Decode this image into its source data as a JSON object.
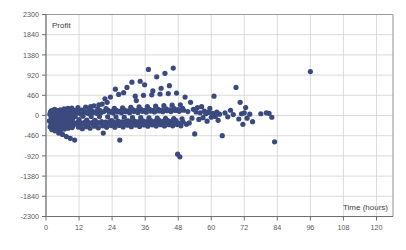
{
  "chart_data": {
    "type": "scatter",
    "title": "",
    "xlabel": "Time (hours)",
    "ylabel": "Profit",
    "xlim": [
      0,
      126
    ],
    "ylim": [
      -2300,
      2300
    ],
    "grid": true,
    "legend": "none",
    "marker_color": "#3b4a7e",
    "marker_size": 2.6,
    "x_ticks": [
      0,
      12,
      24,
      36,
      48,
      60,
      72,
      84,
      96,
      108,
      120
    ],
    "x_tick_labels": [
      "0",
      "12",
      "24",
      "36",
      "48",
      "60",
      "72",
      "84",
      "96",
      "108",
      "120"
    ],
    "y_ticks": [
      -2300,
      -1840,
      -1380,
      -920,
      -460,
      0,
      460,
      920,
      1380,
      1840,
      2300
    ],
    "y_tick_labels": [
      "-2300",
      "-1840",
      "-1380",
      "-920",
      "-460",
      "0",
      "460",
      "920",
      "1380",
      "1840",
      "2300"
    ],
    "points": [
      [
        1.2,
        -120
      ],
      [
        1.4,
        30
      ],
      [
        1.5,
        -260
      ],
      [
        1.6,
        80
      ],
      [
        1.8,
        -180
      ],
      [
        1.9,
        -40
      ],
      [
        2.0,
        110
      ],
      [
        2.1,
        -320
      ],
      [
        2.2,
        -60
      ],
      [
        2.3,
        60
      ],
      [
        2.4,
        -200
      ],
      [
        2.5,
        -10
      ],
      [
        2.6,
        -150
      ],
      [
        2.7,
        90
      ],
      [
        2.8,
        -280
      ],
      [
        2.9,
        20
      ],
      [
        3.0,
        -100
      ],
      [
        3.1,
        140
      ],
      [
        3.2,
        -350
      ],
      [
        3.3,
        -50
      ],
      [
        3.4,
        70
      ],
      [
        3.5,
        -220
      ],
      [
        3.6,
        10
      ],
      [
        3.7,
        -130
      ],
      [
        3.8,
        120
      ],
      [
        3.9,
        -300
      ],
      [
        4.0,
        -70
      ],
      [
        4.1,
        50
      ],
      [
        4.2,
        -240
      ],
      [
        4.3,
        0
      ],
      [
        4.4,
        -160
      ],
      [
        4.5,
        100
      ],
      [
        4.6,
        -400
      ],
      [
        4.7,
        -30
      ],
      [
        4.8,
        80
      ],
      [
        4.9,
        -210
      ],
      [
        5.0,
        30
      ],
      [
        5.1,
        -140
      ],
      [
        5.2,
        130
      ],
      [
        5.3,
        -330
      ],
      [
        5.4,
        -80
      ],
      [
        5.5,
        60
      ],
      [
        5.6,
        -250
      ],
      [
        5.7,
        10
      ],
      [
        5.8,
        -170
      ],
      [
        5.9,
        95
      ],
      [
        6.0,
        -430
      ],
      [
        6.1,
        -20
      ],
      [
        6.2,
        75
      ],
      [
        6.3,
        -230
      ],
      [
        6.4,
        40
      ],
      [
        6.5,
        -120
      ],
      [
        6.6,
        150
      ],
      [
        6.7,
        -310
      ],
      [
        6.8,
        -60
      ],
      [
        6.9,
        55
      ],
      [
        7.0,
        -270
      ],
      [
        7.1,
        5
      ],
      [
        7.2,
        -190
      ],
      [
        7.3,
        105
      ],
      [
        7.4,
        -480
      ],
      [
        7.5,
        -45
      ],
      [
        7.6,
        85
      ],
      [
        7.7,
        -215
      ],
      [
        7.8,
        35
      ],
      [
        7.9,
        -135
      ],
      [
        8.0,
        160
      ],
      [
        8.1,
        -290
      ],
      [
        8.2,
        -75
      ],
      [
        8.3,
        65
      ],
      [
        8.4,
        -245
      ],
      [
        8.5,
        15
      ],
      [
        8.6,
        -185
      ],
      [
        8.7,
        110
      ],
      [
        8.8,
        -520
      ],
      [
        8.9,
        -35
      ],
      [
        9.0,
        90
      ],
      [
        9.1,
        -205
      ],
      [
        9.2,
        45
      ],
      [
        9.3,
        -145
      ],
      [
        9.4,
        170
      ],
      [
        9.5,
        -275
      ],
      [
        9.6,
        -85
      ],
      [
        9.7,
        70
      ],
      [
        9.8,
        -235
      ],
      [
        9.9,
        25
      ],
      [
        10.0,
        -175
      ],
      [
        10.2,
        115
      ],
      [
        10.4,
        -560
      ],
      [
        10.6,
        -25
      ],
      [
        10.8,
        95
      ],
      [
        11.0,
        -195
      ],
      [
        11.2,
        55
      ],
      [
        11.4,
        -155
      ],
      [
        11.6,
        180
      ],
      [
        11.8,
        -265
      ],
      [
        12.0,
        -95
      ],
      [
        12.2,
        75
      ],
      [
        12.4,
        -225
      ],
      [
        12.6,
        35
      ],
      [
        12.8,
        -165
      ],
      [
        13.0,
        125
      ],
      [
        13.2,
        -300
      ],
      [
        13.4,
        -15
      ],
      [
        13.6,
        100
      ],
      [
        13.8,
        -185
      ],
      [
        14.0,
        60
      ],
      [
        14.2,
        -150
      ],
      [
        14.4,
        190
      ],
      [
        14.6,
        -255
      ],
      [
        14.8,
        -105
      ],
      [
        15.0,
        80
      ],
      [
        15.2,
        -215
      ],
      [
        15.4,
        45
      ],
      [
        15.6,
        -160
      ],
      [
        15.8,
        135
      ],
      [
        16.0,
        -290
      ],
      [
        16.2,
        200
      ],
      [
        16.4,
        -20
      ],
      [
        16.6,
        105
      ],
      [
        16.8,
        -180
      ],
      [
        17.0,
        65
      ],
      [
        17.2,
        -145
      ],
      [
        17.4,
        220
      ],
      [
        17.6,
        -245
      ],
      [
        17.8,
        -110
      ],
      [
        18.0,
        85
      ],
      [
        18.2,
        -205
      ],
      [
        18.4,
        50
      ],
      [
        18.6,
        -155
      ],
      [
        18.8,
        145
      ],
      [
        19.0,
        -280
      ],
      [
        19.2,
        240
      ],
      [
        19.4,
        -25
      ],
      [
        19.6,
        110
      ],
      [
        19.8,
        -175
      ],
      [
        20.0,
        70
      ],
      [
        20.2,
        -140
      ],
      [
        20.4,
        260
      ],
      [
        20.6,
        -235
      ],
      [
        20.8,
        -400
      ],
      [
        21.0,
        90
      ],
      [
        21.2,
        -200
      ],
      [
        21.4,
        380
      ],
      [
        21.6,
        -150
      ],
      [
        21.8,
        155
      ],
      [
        22.0,
        -270
      ],
      [
        22.2,
        300
      ],
      [
        22.4,
        -30
      ],
      [
        22.6,
        115
      ],
      [
        22.8,
        -170
      ],
      [
        23.0,
        75
      ],
      [
        23.2,
        -135
      ],
      [
        23.4,
        420
      ],
      [
        23.6,
        -230
      ],
      [
        23.8,
        -115
      ],
      [
        24.0,
        95
      ],
      [
        24.2,
        -195
      ],
      [
        24.4,
        55
      ],
      [
        24.6,
        -148
      ],
      [
        24.8,
        165
      ],
      [
        25.0,
        -265
      ],
      [
        25.2,
        600
      ],
      [
        25.4,
        -35
      ],
      [
        25.6,
        120
      ],
      [
        25.8,
        -168
      ],
      [
        26.0,
        80
      ],
      [
        26.2,
        -130
      ],
      [
        26.4,
        480
      ],
      [
        26.6,
        -225
      ],
      [
        26.8,
        -560
      ],
      [
        27.0,
        100
      ],
      [
        27.2,
        -190
      ],
      [
        27.4,
        60
      ],
      [
        27.6,
        -145
      ],
      [
        27.8,
        175
      ],
      [
        28.0,
        -260
      ],
      [
        28.2,
        520
      ],
      [
        28.4,
        -40
      ],
      [
        28.6,
        125
      ],
      [
        28.8,
        -165
      ],
      [
        29.0,
        85
      ],
      [
        29.2,
        -128
      ],
      [
        29.4,
        640
      ],
      [
        29.6,
        -220
      ],
      [
        29.8,
        -120
      ],
      [
        30.0,
        105
      ],
      [
        30.2,
        -188
      ],
      [
        30.4,
        65
      ],
      [
        30.6,
        -142
      ],
      [
        30.8,
        185
      ],
      [
        31.0,
        -255
      ],
      [
        31.2,
        760
      ],
      [
        31.4,
        -45
      ],
      [
        31.6,
        130
      ],
      [
        31.8,
        -162
      ],
      [
        32.0,
        90
      ],
      [
        32.2,
        -125
      ],
      [
        32.4,
        440
      ],
      [
        32.6,
        -218
      ],
      [
        32.8,
        340
      ],
      [
        33.0,
        110
      ],
      [
        33.2,
        -185
      ],
      [
        33.4,
        70
      ],
      [
        33.6,
        -140
      ],
      [
        33.8,
        195
      ],
      [
        34.0,
        -250
      ],
      [
        34.2,
        780
      ],
      [
        34.4,
        -50
      ],
      [
        34.6,
        135
      ],
      [
        34.8,
        -160
      ],
      [
        35.0,
        95
      ],
      [
        35.2,
        -122
      ],
      [
        35.4,
        460
      ],
      [
        35.6,
        -215
      ],
      [
        35.8,
        700
      ],
      [
        36.0,
        115
      ],
      [
        36.2,
        -182
      ],
      [
        36.4,
        75
      ],
      [
        36.6,
        -138
      ],
      [
        36.8,
        205
      ],
      [
        37.0,
        -245
      ],
      [
        37.2,
        1050
      ],
      [
        37.4,
        -55
      ],
      [
        37.6,
        140
      ],
      [
        37.8,
        -158
      ],
      [
        38.0,
        100
      ],
      [
        38.2,
        -120
      ],
      [
        38.4,
        470
      ],
      [
        38.6,
        -212
      ],
      [
        38.8,
        560
      ],
      [
        39.0,
        120
      ],
      [
        39.2,
        -180
      ],
      [
        39.4,
        80
      ],
      [
        39.6,
        -136
      ],
      [
        39.8,
        215
      ],
      [
        40.0,
        -240
      ],
      [
        40.2,
        880
      ],
      [
        40.4,
        -60
      ],
      [
        40.6,
        145
      ],
      [
        40.8,
        -155
      ],
      [
        41.0,
        105
      ],
      [
        41.2,
        -118
      ],
      [
        41.4,
        490
      ],
      [
        41.6,
        -210
      ],
      [
        41.8,
        620
      ],
      [
        42.0,
        125
      ],
      [
        42.2,
        -178
      ],
      [
        42.4,
        85
      ],
      [
        42.6,
        -134
      ],
      [
        42.8,
        225
      ],
      [
        43.0,
        -238
      ],
      [
        43.2,
        960
      ],
      [
        43.4,
        -65
      ],
      [
        43.6,
        150
      ],
      [
        43.8,
        -152
      ],
      [
        44.0,
        110
      ],
      [
        44.2,
        -116
      ],
      [
        44.4,
        500
      ],
      [
        44.6,
        -208
      ],
      [
        44.8,
        680
      ],
      [
        45.0,
        130
      ],
      [
        45.2,
        -176
      ],
      [
        45.4,
        90
      ],
      [
        45.6,
        -132
      ],
      [
        45.8,
        235
      ],
      [
        46.0,
        -236
      ],
      [
        46.2,
        1080
      ],
      [
        46.4,
        -70
      ],
      [
        46.6,
        155
      ],
      [
        46.8,
        -150
      ],
      [
        47.0,
        115
      ],
      [
        47.2,
        -114
      ],
      [
        47.4,
        510
      ],
      [
        47.6,
        -206
      ],
      [
        47.8,
        -880
      ],
      [
        48.0,
        135
      ],
      [
        48.2,
        -174
      ],
      [
        48.4,
        95
      ],
      [
        48.6,
        -940
      ],
      [
        48.8,
        245
      ],
      [
        49.0,
        -234
      ],
      [
        49.4,
        -75
      ],
      [
        49.6,
        160
      ],
      [
        49.8,
        -148
      ],
      [
        50.0,
        120
      ],
      [
        50.5,
        420
      ],
      [
        51.0,
        -200
      ],
      [
        51.5,
        90
      ],
      [
        52.0,
        -170
      ],
      [
        52.5,
        300
      ],
      [
        53.0,
        -60
      ],
      [
        53.5,
        140
      ],
      [
        54.0,
        -420
      ],
      [
        54.5,
        80
      ],
      [
        55.0,
        180
      ],
      [
        55.5,
        -90
      ],
      [
        56.0,
        60
      ],
      [
        56.5,
        200
      ],
      [
        57.0,
        -50
      ],
      [
        57.5,
        100
      ],
      [
        58.0,
        40
      ],
      [
        58.5,
        -130
      ],
      [
        59.0,
        70
      ],
      [
        59.5,
        160
      ],
      [
        60.0,
        -40
      ],
      [
        60.5,
        50
      ],
      [
        61.0,
        440
      ],
      [
        61.5,
        -20
      ],
      [
        62.0,
        80
      ],
      [
        62.5,
        -110
      ],
      [
        63.0,
        30
      ],
      [
        64.0,
        -460
      ],
      [
        65.0,
        60
      ],
      [
        66.0,
        -30
      ],
      [
        67.0,
        120
      ],
      [
        68.0,
        20
      ],
      [
        69.0,
        640
      ],
      [
        70.0,
        -80
      ],
      [
        70.5,
        300
      ],
      [
        71.0,
        40
      ],
      [
        71.5,
        -200
      ],
      [
        72.0,
        60
      ],
      [
        72.5,
        180
      ],
      [
        73.0,
        -60
      ],
      [
        74.0,
        30
      ],
      [
        75.0,
        -140
      ],
      [
        78.0,
        40
      ],
      [
        80.0,
        60
      ],
      [
        81.0,
        50
      ],
      [
        82.0,
        -40
      ],
      [
        83.0,
        -600
      ],
      [
        96.0,
        1000
      ]
    ]
  }
}
